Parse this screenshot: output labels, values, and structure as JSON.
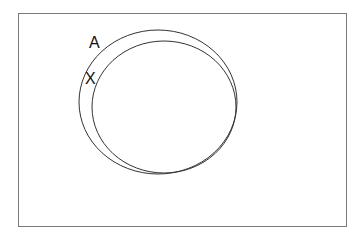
{
  "diagram": {
    "type": "venn",
    "frame": {
      "x": 18,
      "y": 13,
      "width": 328,
      "height": 213,
      "stroke": "#7a7a7a"
    },
    "sets": [
      {
        "name": "A",
        "label": "A",
        "cx": 158,
        "cy": 102,
        "rx": 79,
        "ry": 72,
        "label_x": 89,
        "label_y": 48
      },
      {
        "name": "X",
        "label": "X",
        "cx": 164,
        "cy": 107,
        "rx": 72,
        "ry": 66,
        "label_x": 85,
        "label_y": 84
      }
    ],
    "stroke_color": "#333333"
  }
}
